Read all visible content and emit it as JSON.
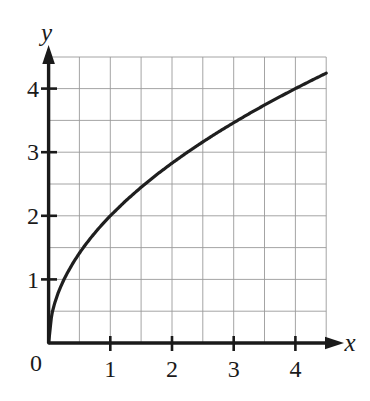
{
  "figure": {
    "background_color": "#ffffff",
    "ink_color": "#1a1a1a",
    "grid_color": "#9a9a9a"
  },
  "axes": {
    "x_axis_label": "x",
    "y_axis_label": "y",
    "origin_label": "0",
    "x_tick_labels": [
      "1",
      "2",
      "3",
      "4"
    ],
    "y_tick_labels": [
      "1",
      "2",
      "3",
      "4"
    ]
  },
  "chart_data": {
    "type": "line",
    "title": "",
    "subtitle": "",
    "xlabel": "x",
    "ylabel": "y",
    "equation": "y = 2*sqrt(x)",
    "xlim": [
      0,
      4.5
    ],
    "ylim": [
      0,
      4.45
    ],
    "xticks": [
      1,
      2,
      3,
      4
    ],
    "yticks": [
      1,
      2,
      3,
      4
    ],
    "xtick_labels": [
      "1",
      "2",
      "3",
      "4"
    ],
    "ytick_labels": [
      "1",
      "2",
      "3",
      "4"
    ],
    "grid": true,
    "grid_spacing": 0.5,
    "legend": null,
    "annotations": [],
    "series": [
      {
        "name": "y = 2√x",
        "x": [
          0,
          0.05,
          0.1,
          0.15,
          0.2,
          0.25,
          0.3,
          0.4,
          0.5,
          0.6,
          0.7,
          0.8,
          0.9,
          1.0,
          1.25,
          1.5,
          1.75,
          2.0,
          2.25,
          2.5,
          2.75,
          3.0,
          3.25,
          3.5,
          3.75,
          4.0,
          4.25,
          4.5
        ],
        "y": [
          0,
          0.447,
          0.632,
          0.775,
          0.894,
          1.0,
          1.095,
          1.265,
          1.414,
          1.549,
          1.673,
          1.789,
          1.897,
          2.0,
          2.236,
          2.449,
          2.646,
          2.828,
          3.0,
          3.162,
          3.317,
          3.464,
          3.606,
          3.742,
          3.873,
          4.0,
          4.123,
          4.243
        ]
      }
    ]
  }
}
